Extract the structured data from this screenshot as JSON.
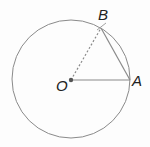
{
  "diagram": {
    "type": "circle-geometry",
    "labels": {
      "center": "O",
      "point_a": "A",
      "point_b": "B"
    },
    "circle": {
      "cx": 71,
      "cy": 79,
      "r": 59
    },
    "points": {
      "O": {
        "x": 71,
        "y": 80
      },
      "A": {
        "x": 130,
        "y": 80
      },
      "B": {
        "x": 101,
        "y": 28
      }
    },
    "segments": [
      {
        "from": "O",
        "to": "A",
        "style": "solid"
      },
      {
        "from": "O",
        "to": "B",
        "style": "dashed"
      },
      {
        "from": "B",
        "to": "A",
        "style": "solid"
      }
    ],
    "colors": {
      "stroke": "#8a8a8a",
      "text": "#222222",
      "dot": "#555555"
    }
  }
}
